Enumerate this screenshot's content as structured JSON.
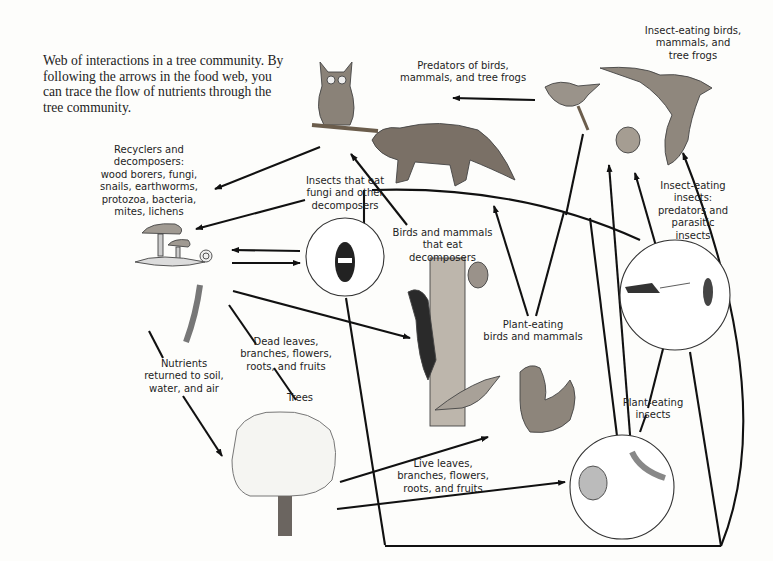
{
  "figure": {
    "caption": "Web of interactions in a tree community. By following the arrows in the food web, you can trace the flow of nutrients through the tree community."
  },
  "labels": {
    "predators": "Predators of birds,\nmammals, and tree frogs",
    "insect_eating_vertebrates": "Insect-eating birds,\nmammals, and\ntree frogs",
    "recyclers": "Recyclers and\ndecomposers:\nwood borers, fungi,\nsnails, earthworms,\nprotozoa, bacteria,\nmites, lichens",
    "insects_eat_fungi": "Insects that eat\nfungi and other\ndecomposers",
    "birds_eat_decomposers": "Birds and mammals\nthat eat decomposers",
    "insect_eating_insects": "Insect-eating\ninsects:\npredators and\nparasitic\ninsects",
    "plant_eating_vertebrates": "Plant-eating\nbirds and mammals",
    "dead_matter": "Dead leaves,\nbranches, flowers,\nroots, and fruits",
    "nutrients_returned": "Nutrients\nreturned to soil,\nwater, and air",
    "trees": "Trees",
    "plant_eating_insects": "Plant-eating\ninsects",
    "live_matter": "Live leaves,\nbranches, flowers,\nroots, and fruits"
  },
  "nodes": [
    {
      "id": "owl",
      "icon": "owl-illustration"
    },
    {
      "id": "marten",
      "icon": "marten-illustration"
    },
    {
      "id": "wren",
      "icon": "wren-illustration"
    },
    {
      "id": "bat",
      "icon": "bat-illustration"
    },
    {
      "id": "tree-frog",
      "icon": "tree-frog-illustration"
    },
    {
      "id": "decomposers",
      "icon": "mushroom-snail-illustration"
    },
    {
      "id": "earthworm",
      "icon": "earthworm-illustration"
    },
    {
      "id": "fungus-beetle",
      "icon": "beetle-illustration"
    },
    {
      "id": "woodpecker-squirrel",
      "icon": "woodpecker-illustration"
    },
    {
      "id": "predatory-insects",
      "icon": "cricket-wasp-illustration"
    },
    {
      "id": "thrush-squirrel",
      "icon": "thrush-squirrel-illustration"
    },
    {
      "id": "tree",
      "icon": "tree-illustration"
    },
    {
      "id": "plant-eating-insects",
      "icon": "cicada-caterpillar-illustration"
    }
  ],
  "colors": {
    "background": "#fdfdfb",
    "line": "#111111",
    "text": "#1e1e1e"
  }
}
